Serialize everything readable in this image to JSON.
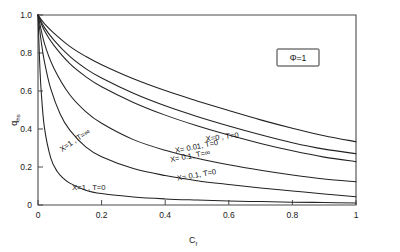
{
  "chart_data": {
    "type": "line",
    "title": "",
    "xlabel": "C_f",
    "ylabel": "q_hs",
    "xlim": [
      0,
      1
    ],
    "ylim": [
      0,
      1
    ],
    "grid": false,
    "legend_position": "inline-annotations",
    "annotation_box": "Φ=1",
    "xticks": [
      0,
      0.2,
      0.4,
      0.6,
      0.8,
      1
    ],
    "xticklabels": [
      "0",
      "0.2",
      "0.4",
      "0.6",
      "0.8",
      "1"
    ],
    "yticks": [
      0,
      0.2,
      0.4,
      0.6,
      0.8,
      1.0
    ],
    "yticklabels": [
      "0",
      "0.2",
      "0.4",
      "0.6",
      "0.8",
      "1.0"
    ],
    "series": [
      {
        "name": "X=0 , T=0",
        "label": "X=0  ,  T=0",
        "x": [
          0,
          0.02,
          0.05,
          0.1,
          0.15,
          0.2,
          0.3,
          0.4,
          0.5,
          0.6,
          0.7,
          0.8,
          0.9,
          1.0
        ],
        "values": [
          1.0,
          0.955,
          0.905,
          0.835,
          0.782,
          0.738,
          0.664,
          0.602,
          0.548,
          0.497,
          0.448,
          0.404,
          0.365,
          0.333
        ]
      },
      {
        "name": "X=0.01, T=0",
        "label": "X= 0.01, T=0",
        "x": [
          0,
          0.02,
          0.05,
          0.1,
          0.15,
          0.2,
          0.3,
          0.4,
          0.5,
          0.6,
          0.7,
          0.8,
          0.9,
          1.0
        ],
        "values": [
          1.0,
          0.935,
          0.868,
          0.782,
          0.718,
          0.668,
          0.588,
          0.522,
          0.466,
          0.416,
          0.37,
          0.328,
          0.294,
          0.27
        ]
      },
      {
        "name": "X=0.1, T=inf",
        "label": "X= 0.1, T=∞",
        "x": [
          0,
          0.02,
          0.05,
          0.1,
          0.15,
          0.2,
          0.3,
          0.4,
          0.5,
          0.6,
          0.7,
          0.8,
          0.9,
          1.0
        ],
        "values": [
          1.0,
          0.918,
          0.84,
          0.744,
          0.676,
          0.622,
          0.54,
          0.473,
          0.417,
          0.368,
          0.324,
          0.285,
          0.252,
          0.228
        ]
      },
      {
        "name": "X=0.1, T=0",
        "label": "X= 0.1, T=0",
        "x": [
          0,
          0.02,
          0.05,
          0.1,
          0.15,
          0.2,
          0.3,
          0.4,
          0.5,
          0.6,
          0.7,
          0.8,
          0.9,
          1.0
        ],
        "values": [
          1.0,
          0.852,
          0.72,
          0.58,
          0.492,
          0.43,
          0.344,
          0.288,
          0.246,
          0.212,
          0.183,
          0.158,
          0.137,
          0.122
        ]
      },
      {
        "name": "X=1 , T=inf",
        "label": "X=1 , T=∞",
        "x": [
          0,
          0.01,
          0.02,
          0.04,
          0.07,
          0.1,
          0.15,
          0.2,
          0.3,
          0.4,
          0.5,
          0.6,
          0.7,
          0.8,
          0.9,
          1.0
        ],
        "values": [
          1.0,
          0.862,
          0.756,
          0.612,
          0.478,
          0.394,
          0.306,
          0.254,
          0.192,
          0.155,
          0.128,
          0.108,
          0.09,
          0.074,
          0.058,
          0.043
        ]
      },
      {
        "name": "X=1 , T=0",
        "label": "X=1 , T=0",
        "x": [
          0,
          0.005,
          0.01,
          0.02,
          0.04,
          0.06,
          0.08,
          0.1,
          0.15,
          0.2,
          0.3,
          0.4,
          0.5,
          0.6,
          0.7,
          0.8,
          0.9,
          1.0
        ],
        "values": [
          1.0,
          0.76,
          0.6,
          0.41,
          0.248,
          0.178,
          0.14,
          0.115,
          0.078,
          0.06,
          0.042,
          0.032,
          0.026,
          0.021,
          0.018,
          0.015,
          0.013,
          0.011
        ]
      }
    ],
    "curve_label_positions": [
      {
        "text": "X=0  ,  T=0",
        "x": 0.58,
        "y": 0.345,
        "rotate": -7
      },
      {
        "text": "X= 0.01, T=0",
        "x": 0.5,
        "y": 0.295,
        "rotate": -11
      },
      {
        "text": "X= 0.1, T=∞",
        "x": 0.48,
        "y": 0.245,
        "rotate": -11
      },
      {
        "text": "X= 0.1, T=0",
        "x": 0.5,
        "y": 0.145,
        "rotate": -10
      },
      {
        "text": "X=1 , T=∞",
        "x": 0.12,
        "y": 0.33,
        "rotate": -34
      },
      {
        "text": "X=1 , T=0",
        "x": 0.16,
        "y": 0.078,
        "rotate": 0
      }
    ]
  },
  "axis": {
    "x_title": "C",
    "x_title_sub": "f",
    "y_title": "q",
    "y_title_sub": "hs"
  }
}
